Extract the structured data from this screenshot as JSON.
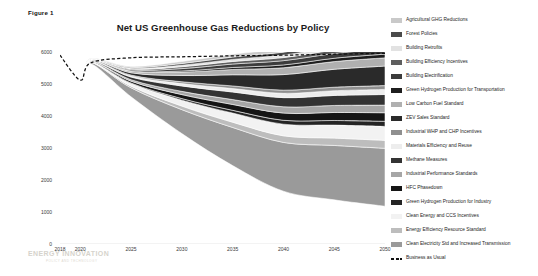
{
  "figure": {
    "label": "Figure 1",
    "title": "Net US Greenhouse Gas Reductions by Policy",
    "watermark": "ENERGY INNOVATION",
    "watermark_sub": "POLICY AND TECHNOLOGY"
  },
  "chart_data": {
    "type": "area",
    "title": "Net US Greenhouse Gas Reductions by Policy",
    "xlabel": "",
    "ylabel": "Million Metric Tons / Year",
    "xlim": [
      2018,
      2050
    ],
    "ylim": [
      0,
      6000
    ],
    "x_ticks": [
      2018,
      2020,
      2025,
      2030,
      2035,
      2040,
      2045,
      2050
    ],
    "y_ticks": [
      0,
      1000,
      2000,
      3000,
      4000,
      5000,
      6000
    ],
    "grid": false,
    "legend_position": "right",
    "x": [
      2018,
      2020,
      2021,
      2025,
      2030,
      2035,
      2040,
      2045,
      2050
    ],
    "baseline": {
      "name": "Business as Usual",
      "style": "dashed",
      "color": "#111111",
      "values": [
        5900,
        5120,
        5660,
        5820,
        5850,
        5880,
        5900,
        5930,
        5960
      ]
    },
    "net_emissions": {
      "name": "Net emissions (top of remaining area)",
      "values": [
        5900,
        5120,
        5640,
        4600,
        3450,
        2450,
        1650,
        1380,
        1180
      ]
    },
    "series": [
      {
        "name": "Agricultural GHG Reductions",
        "color": "#c9c9c9",
        "values": [
          0,
          0,
          6,
          30,
          62,
          86,
          104,
          114,
          122
        ]
      },
      {
        "name": "Forest Policies",
        "color": "#4a4a4a",
        "values": [
          0,
          0,
          5,
          26,
          54,
          76,
          92,
          101,
          108
        ]
      },
      {
        "name": "Building Retrofits",
        "color": "#e2e2e2",
        "values": [
          0,
          0,
          4,
          22,
          46,
          64,
          78,
          86,
          92
        ]
      },
      {
        "name": "Building Efficiency Incentives",
        "color": "#5e5e5e",
        "values": [
          0,
          0,
          5,
          28,
          58,
          80,
          96,
          105,
          112
        ]
      },
      {
        "name": "Building Electrification",
        "color": "#3c3c3c",
        "values": [
          0,
          0,
          6,
          34,
          74,
          108,
          134,
          150,
          162
        ]
      },
      {
        "name": "Green Hydrogen Production for Transportation",
        "color": "#1e1e1e",
        "values": [
          0,
          0,
          2,
          12,
          34,
          62,
          88,
          104,
          116
        ]
      },
      {
        "name": "Low Carbon Fuel Standard",
        "color": "#b0b0b0",
        "values": [
          0,
          0,
          8,
          48,
          108,
          166,
          214,
          240,
          258
        ]
      },
      {
        "name": "ZEV Sales Standard",
        "color": "#2a2a2a",
        "values": [
          0,
          0,
          10,
          72,
          196,
          348,
          486,
          560,
          610
        ]
      },
      {
        "name": "Industrial WHP and CHP Incentives",
        "color": "#8f8f8f",
        "values": [
          0,
          0,
          5,
          28,
          58,
          82,
          100,
          110,
          118
        ]
      },
      {
        "name": "Materials Efficiency and Reuse",
        "color": "#ededed",
        "values": [
          0,
          0,
          6,
          34,
          74,
          108,
          134,
          148,
          160
        ]
      },
      {
        "name": "Methane Measures",
        "color": "#333333",
        "values": [
          0,
          0,
          14,
          82,
          168,
          236,
          286,
          312,
          332
        ]
      },
      {
        "name": "Industrial Performance Standards",
        "color": "#a6a6a6",
        "values": [
          0,
          0,
          8,
          46,
          102,
          154,
          196,
          220,
          238
        ]
      },
      {
        "name": "HFC Phasedown",
        "color": "#151515",
        "values": [
          0,
          0,
          10,
          58,
          124,
          182,
          226,
          250,
          268
        ]
      },
      {
        "name": "Green Hydrogen Production for Industry",
        "color": "#242424",
        "values": [
          0,
          0,
          3,
          18,
          48,
          86,
          122,
          144,
          160
        ]
      },
      {
        "name": "Clean Energy and CCS Incentives",
        "color": "#f2f2f2",
        "values": [
          0,
          0,
          12,
          80,
          186,
          286,
          364,
          406,
          436
        ]
      },
      {
        "name": "Energy Efficiency Resource Standard",
        "color": "#bdbdbd",
        "values": [
          0,
          0,
          9,
          52,
          112,
          164,
          206,
          230,
          248
        ]
      },
      {
        "name": "Clean Electricity Std and Increased Transmission",
        "color": "#9a9a9a",
        "values": [
          0,
          0,
          42,
          280,
          748,
          1192,
          1524,
          1700,
          1810
        ]
      }
    ]
  },
  "legend": {
    "items": [
      {
        "label": "Agricultural GHG Reductions",
        "color": "#c9c9c9",
        "style": "swatch"
      },
      {
        "label": "Forest Policies",
        "color": "#4a4a4a",
        "style": "swatch"
      },
      {
        "label": "Building Retrofits",
        "color": "#e2e2e2",
        "style": "swatch"
      },
      {
        "label": "Building Efficiency Incentives",
        "color": "#5e5e5e",
        "style": "swatch"
      },
      {
        "label": "Building Electrification",
        "color": "#3c3c3c",
        "style": "swatch"
      },
      {
        "label": "Green Hydrogen Production for Transportation",
        "color": "#1e1e1e",
        "style": "swatch"
      },
      {
        "label": "Low Carbon Fuel Standard",
        "color": "#b0b0b0",
        "style": "swatch"
      },
      {
        "label": "ZEV Sales Standard",
        "color": "#2a2a2a",
        "style": "swatch"
      },
      {
        "label": "Industrial WHP and CHP Incentives",
        "color": "#8f8f8f",
        "style": "swatch"
      },
      {
        "label": "Materials Efficiency and Reuse",
        "color": "#ededed",
        "style": "swatch"
      },
      {
        "label": "Methane Measures",
        "color": "#333333",
        "style": "swatch"
      },
      {
        "label": "Industrial Performance Standards",
        "color": "#a6a6a6",
        "style": "swatch"
      },
      {
        "label": "HFC Phasedown",
        "color": "#151515",
        "style": "swatch"
      },
      {
        "label": "Green Hydrogen Production for Industry",
        "color": "#242424",
        "style": "swatch"
      },
      {
        "label": "Clean Energy and CCS Incentives",
        "color": "#f2f2f2",
        "style": "swatch"
      },
      {
        "label": "Energy Efficiency Resource Standard",
        "color": "#bdbdbd",
        "style": "swatch"
      },
      {
        "label": "Clean Electricity Std and Increased Transmission",
        "color": "#9a9a9a",
        "style": "swatch"
      },
      {
        "label": "Business as Usual",
        "color": "#111111",
        "style": "dashed"
      }
    ]
  }
}
